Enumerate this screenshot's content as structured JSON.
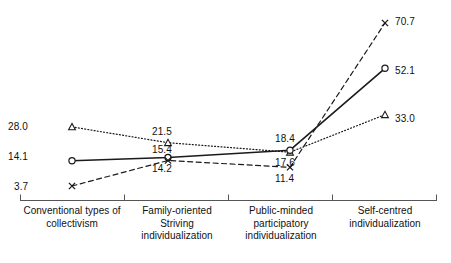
{
  "chart_data": {
    "type": "line",
    "title": "",
    "subtitle": "",
    "xlabel": "",
    "ylabel": "",
    "grid": false,
    "legend": "none",
    "axis": {
      "x_axis_line": true,
      "y_axis_line": false,
      "ticks_at_category_boundaries": true
    },
    "categories": [
      "Conventional types of collectivism",
      "Family-oriented Striving individualization",
      "Public-minded participatory individualization",
      "Self-centred individualization"
    ],
    "category_label_lines": [
      [
        "Conventional types of",
        "collectivism"
      ],
      [
        "Family-oriented",
        "Striving",
        "individualization"
      ],
      [
        "Public-minded",
        "participatory",
        "individualization"
      ],
      [
        "Self-centred",
        "individualization"
      ]
    ],
    "ylim": [
      0,
      75
    ],
    "series": [
      {
        "name": "dotted-triangle-series",
        "marker": "triangle",
        "line_style": "dotted",
        "color": "#1a1a1a",
        "values": [
          28.0,
          21.5,
          17.6,
          33.0
        ],
        "labels": [
          "28.0",
          "21.5",
          "17.6",
          "33.0"
        ]
      },
      {
        "name": "solid-circle-series",
        "marker": "circle",
        "line_style": "solid",
        "color": "#1a1a1a",
        "values": [
          14.1,
          15.4,
          18.4,
          52.1
        ],
        "labels": [
          "14.1",
          "15.4",
          "18.4",
          "52.1"
        ]
      },
      {
        "name": "dashed-cross-series",
        "marker": "cross",
        "line_style": "dashed",
        "color": "#1a1a1a",
        "values": [
          3.7,
          14.2,
          11.4,
          70.7
        ],
        "labels": [
          "3.7",
          "14.2",
          "11.4",
          "70.7"
        ]
      }
    ]
  },
  "labels": {
    "s1_c1": "28.0",
    "s1_c2": "21.5",
    "s1_c3": "17.6",
    "s1_c4": "33.0",
    "s2_c1": "14.1",
    "s2_c2": "15.4",
    "s2_c3": "18.4",
    "s2_c4": "52.1",
    "s3_c1": "3.7",
    "s3_c2": "14.2",
    "s3_c3": "11.4",
    "s3_c4": "70.7"
  },
  "categories": {
    "c1_l1": "Conventional types of",
    "c1_l2": "collectivism",
    "c2_l1": "Family-oriented",
    "c2_l2": "Striving",
    "c2_l3": "individualization",
    "c3_l1": "Public-minded",
    "c3_l2": "participatory",
    "c3_l3": "individualization",
    "c4_l1": "Self-centred",
    "c4_l2": "individualization"
  }
}
